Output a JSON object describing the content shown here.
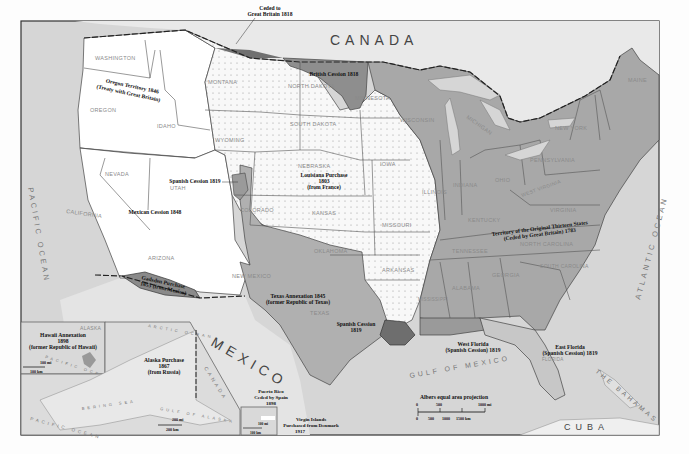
{
  "map": {
    "projection_note": "Albers equal area projection",
    "colors": {
      "background": "#fdfdfd",
      "water": "#d4d4d4",
      "foreign_land": "#e6e6e6",
      "oregon_mexican_cession": "#ffffff",
      "louisiana_purchase": "#f7f7f7",
      "original_thirteen": "#a9a9a9",
      "texas_annexation": "#b3b3b3",
      "british_cession": "#8f8f8f",
      "spanish_cession": "#7d7d7d",
      "gadsden": "#8a8a8a",
      "border": "#333333"
    },
    "countries": {
      "canada": "CANADA",
      "mexico": "MEXICO",
      "cuba": "CUBA",
      "bahamas": "THE BAHAMAS",
      "canada_alaska_inset": "CANADA"
    },
    "oceans": {
      "pacific": "PACIFIC OCEAN",
      "atlantic": "ATLANTIC OCEAN",
      "gulf": "GULF OF MEXICO"
    },
    "states": [
      {
        "name": "WASHINGTON",
        "x": 116,
        "y": 62
      },
      {
        "name": "OREGON",
        "x": 100,
        "y": 112
      },
      {
        "name": "IDAHO",
        "x": 165,
        "y": 128
      },
      {
        "name": "MONTANA",
        "x": 225,
        "y": 84
      },
      {
        "name": "WYOMING",
        "x": 235,
        "y": 142
      },
      {
        "name": "NORTH DAKOTA",
        "x": 315,
        "y": 88
      },
      {
        "name": "SOUTH DAKOTA",
        "x": 318,
        "y": 126
      },
      {
        "name": "MINNESOTA",
        "x": 373,
        "y": 100
      },
      {
        "name": "WISCONSIN",
        "x": 420,
        "y": 122
      },
      {
        "name": "MICHIGAN",
        "x": 478,
        "y": 118
      },
      {
        "name": "NEW YORK",
        "x": 570,
        "y": 130
      },
      {
        "name": "MAINE",
        "x": 640,
        "y": 82
      },
      {
        "name": "NEVADA",
        "x": 120,
        "y": 176
      },
      {
        "name": "UTAH",
        "x": 178,
        "y": 188
      },
      {
        "name": "COLORADO",
        "x": 260,
        "y": 212
      },
      {
        "name": "NEBRASKA",
        "x": 315,
        "y": 168
      },
      {
        "name": "IOWA",
        "x": 388,
        "y": 166
      },
      {
        "name": "ILLINOIS",
        "x": 438,
        "y": 194
      },
      {
        "name": "INDIANA",
        "x": 467,
        "y": 187
      },
      {
        "name": "OHIO",
        "x": 505,
        "y": 182
      },
      {
        "name": "PENNSYLVANIA",
        "x": 553,
        "y": 162
      },
      {
        "name": "WEST VIRGINIA",
        "x": 534,
        "y": 197
      },
      {
        "name": "VIRGINIA",
        "x": 565,
        "y": 212
      },
      {
        "name": "KENTUCKY",
        "x": 485,
        "y": 222
      },
      {
        "name": "TENNESSEE",
        "x": 470,
        "y": 253
      },
      {
        "name": "NORTH CAROLINA",
        "x": 553,
        "y": 243
      },
      {
        "name": "SOUTH CAROLINA",
        "x": 553,
        "y": 268
      },
      {
        "name": "GEORGIA",
        "x": 510,
        "y": 275
      },
      {
        "name": "ALABAMA",
        "x": 470,
        "y": 288
      },
      {
        "name": "MISSISSIPPI",
        "x": 432,
        "y": 301
      },
      {
        "name": "CALIFORNIA",
        "x": 88,
        "y": 213
      },
      {
        "name": "ARIZONA",
        "x": 162,
        "y": 258
      },
      {
        "name": "NEW MEXICO",
        "x": 250,
        "y": 277
      },
      {
        "name": "KANSAS",
        "x": 323,
        "y": 215
      },
      {
        "name": "MISSOURI",
        "x": 398,
        "y": 227
      },
      {
        "name": "OKLAHOMA",
        "x": 330,
        "y": 253
      },
      {
        "name": "ARKANSAS",
        "x": 398,
        "y": 272
      },
      {
        "name": "TEXAS",
        "x": 320,
        "y": 315
      },
      {
        "name": "FLORIDA",
        "x": 555,
        "y": 361
      },
      {
        "name": "HAWAII",
        "x": 87,
        "y": 330
      },
      {
        "name": "ALASKA",
        "x": 168,
        "y": 382
      }
    ],
    "annotations": [
      {
        "id": "ceded-gb",
        "lines": [
          "Ceded to",
          "Great Britain 1818"
        ],
        "x": 270,
        "y": 13
      },
      {
        "id": "british-cession",
        "lines": [
          "British Cession 1818"
        ],
        "x": 334,
        "y": 76
      },
      {
        "id": "oregon-territory",
        "lines": [
          "Oregon Territory 1846",
          "(Treaty with Great Britain)"
        ],
        "x": 127,
        "y": 88
      },
      {
        "id": "louisiana",
        "lines": [
          "Louisiana Purchase",
          "1803",
          "(from France)"
        ],
        "x": 324,
        "y": 178
      },
      {
        "id": "spanish-cession-1819-utah",
        "lines": [
          "Spanish Cession 1819"
        ],
        "x": 195,
        "y": 183
      },
      {
        "id": "mexican-cession",
        "lines": [
          "Mexican Cession 1848"
        ],
        "x": 155,
        "y": 214
      },
      {
        "id": "gadsden",
        "lines": [
          "Gadsden Purchase",
          "1853 (from Mexico)"
        ],
        "x": 163,
        "y": 285
      },
      {
        "id": "texas",
        "lines": [
          "Texas Annexation 1845",
          "(former Republic of Texas)"
        ],
        "x": 298,
        "y": 298
      },
      {
        "id": "spanish-cession-1819-tx",
        "lines": [
          "Spanish Cession",
          "1819"
        ],
        "x": 356,
        "y": 326
      },
      {
        "id": "thirteen",
        "lines": [
          "Territory of the Original Thirteen States",
          "(Ceded by Great Britain) 1783"
        ],
        "x": 540,
        "y": 230
      },
      {
        "id": "west-florida",
        "lines": [
          "West Florida",
          "(Spanish Cession) 1819"
        ],
        "x": 473,
        "y": 347
      },
      {
        "id": "east-florida",
        "lines": [
          "East Florida",
          "(Spanish Cession) 1819"
        ],
        "x": 570,
        "y": 350
      },
      {
        "id": "hawaii",
        "lines": [
          "Hawaii Annexation",
          "1898",
          "(former Republic of Hawaii)"
        ],
        "x": 61,
        "y": 336
      },
      {
        "id": "alaska",
        "lines": [
          "Alaska Purchase",
          "1867",
          "(from Russia)"
        ],
        "x": 164,
        "y": 362
      },
      {
        "id": "puerto-rico",
        "lines": [
          "Puerto Rico",
          "Ceded by Spain",
          "1898"
        ],
        "x": 271,
        "y": 394
      },
      {
        "id": "virgin-islands",
        "lines": [
          "Virgin Islands",
          "Purchased from Denmark",
          "1917"
        ],
        "x": 311,
        "y": 422
      }
    ],
    "scale_bar": {
      "title": "Albers equal area projection",
      "mi_labels": [
        "0",
        "500",
        "1000 mi"
      ],
      "km_labels": [
        "0",
        "500",
        "1000",
        "1500 km"
      ]
    },
    "inset_scales": {
      "hawaii": [
        "100 mi",
        "100 km"
      ],
      "alaska": [
        "200 mi",
        "200 km"
      ],
      "puerto_rico": [
        "100 mi",
        "100 km"
      ]
    },
    "minor_labels": {
      "arctic_ocean": "ARCTIC OCEAN",
      "bering_sea": "BERING SEA",
      "gulf_of_alaska": "GULF OF ALASKA",
      "pacific_inset": "PACIFIC OCEAN",
      "pacific_hawaii": "PACIFIC OCEAN"
    }
  }
}
